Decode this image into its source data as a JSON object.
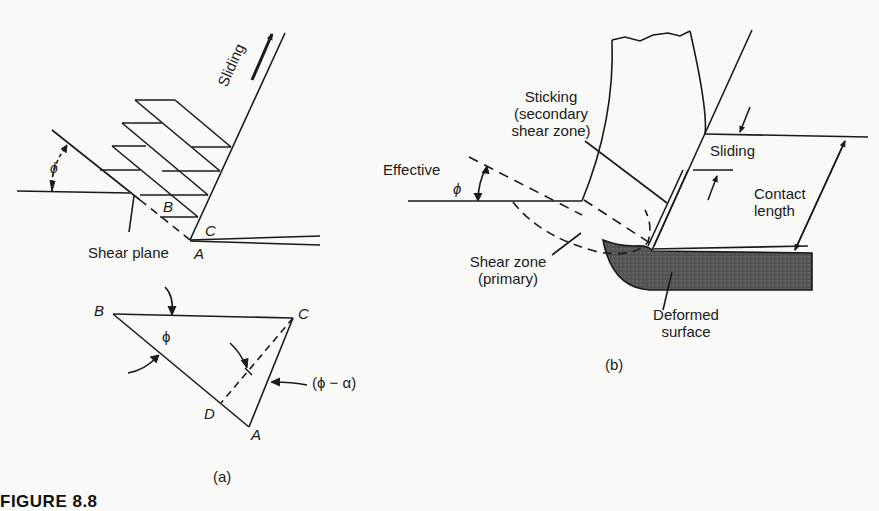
{
  "figure": {
    "caption": "FIGURE 8.8",
    "panels": [
      {
        "id": "a",
        "label": "(a)",
        "annotations": {
          "sliding": "Sliding",
          "shear_plane": "Shear plane",
          "phi": "ϕ",
          "point_a": "A",
          "point_b": "B",
          "point_c": "C",
          "triangle": {
            "vertex_b": "B",
            "vertex_c": "C",
            "vertex_d": "D",
            "vertex_a": "A",
            "angle_phi": "ϕ",
            "angle_phi_minus_alpha": "(ϕ − α)"
          }
        }
      },
      {
        "id": "b",
        "label": "(b)",
        "annotations": {
          "sticking_line1": "Sticking",
          "sticking_line2": "(secondary",
          "sticking_line3": "shear zone)",
          "effective": "Effective",
          "phi": "ϕ",
          "sliding": "Sliding",
          "contact_line1": "Contact",
          "contact_line2": "length",
          "shear_zone_line1": "Shear zone",
          "shear_zone_line2": "(primary)",
          "deformed_line1": "Deformed",
          "deformed_line2": "surface"
        }
      }
    ]
  },
  "colors": {
    "ink": "#1a1a1a",
    "workpiece_fill": "#5a5a5a",
    "paper": "#f9f9f7"
  }
}
